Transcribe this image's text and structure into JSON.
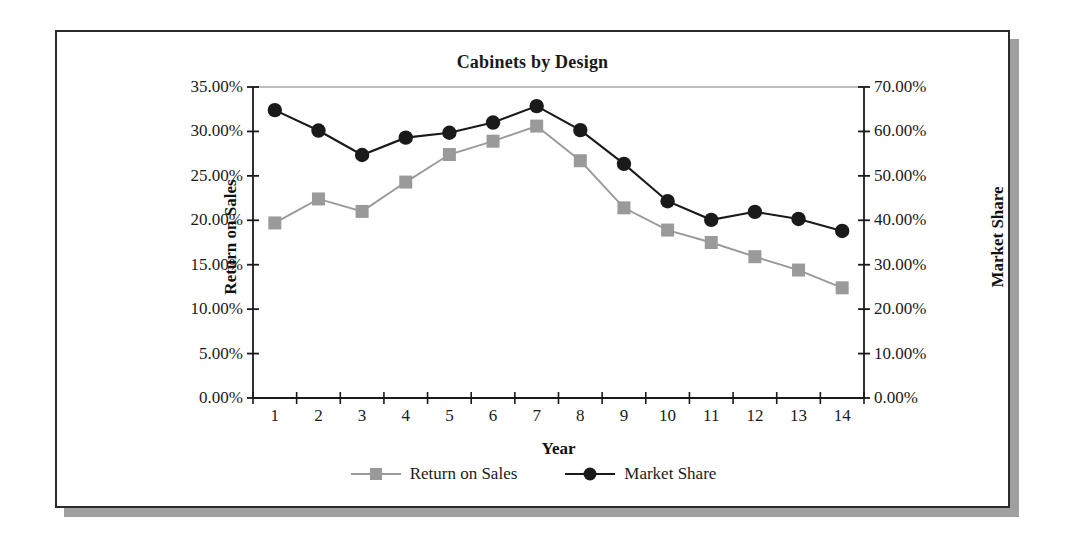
{
  "chart_data": {
    "type": "line",
    "title": "Cabinets by Design",
    "xlabel": "Year",
    "ylabel": "Return on  Sales",
    "y2label": "Market Share",
    "categories": [
      "1",
      "2",
      "3",
      "4",
      "5",
      "6",
      "7",
      "8",
      "9",
      "10",
      "11",
      "12",
      "13",
      "14"
    ],
    "ylim": [
      0,
      35
    ],
    "y2lim": [
      0,
      70
    ],
    "yticks": [
      "0.00%",
      "5.00%",
      "10.00%",
      "15.00%",
      "20.00%",
      "25.00%",
      "30.00%",
      "35.00%"
    ],
    "ytick_values": [
      0,
      5,
      10,
      15,
      20,
      25,
      30,
      35
    ],
    "y2ticks": [
      "0.00%",
      "10.00%",
      "20.00%",
      "30.00%",
      "40.00%",
      "50.00%",
      "60.00%",
      "70.00%"
    ],
    "y2tick_values": [
      0,
      10,
      20,
      30,
      40,
      50,
      60,
      70
    ],
    "grid": "top-line-only",
    "legend_position": "bottom-center",
    "series": [
      {
        "name": "Return on Sales",
        "axis": "left",
        "color": "#9a9a9a",
        "marker": "square",
        "values": [
          19.7,
          22.4,
          21.0,
          24.3,
          27.4,
          28.9,
          30.6,
          26.7,
          21.4,
          18.9,
          17.5,
          15.9,
          14.4,
          12.4
        ]
      },
      {
        "name": "Market Share",
        "axis": "right",
        "color": "#1a1a1a",
        "marker": "circle",
        "values": [
          64.8,
          60.2,
          54.7,
          58.6,
          59.7,
          62.0,
          65.7,
          60.3,
          52.7,
          44.3,
          40.1,
          41.9,
          40.3,
          37.6
        ]
      }
    ]
  }
}
